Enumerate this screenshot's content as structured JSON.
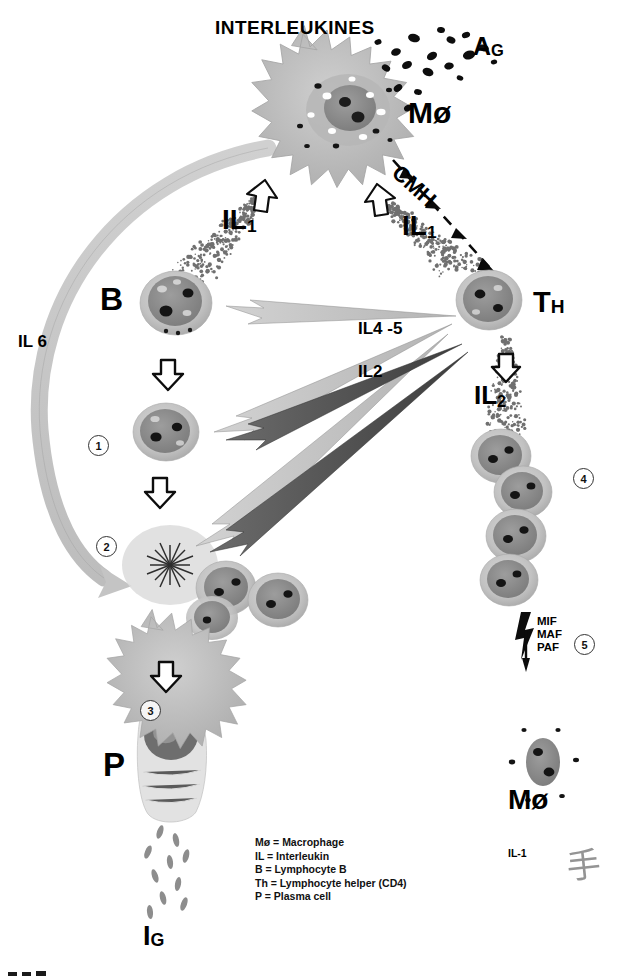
{
  "diagram": {
    "title": "INTERLEUKINES",
    "labels": {
      "antigen": "A",
      "antigen_sub": "G",
      "macrophage_top": "Mø",
      "macrophage_bottom": "Mø",
      "cmh": "CMH",
      "il1_left": "IL",
      "il1_left_sub": "1",
      "il1_right": "IL",
      "il1_right_sub": "1",
      "il6": "IL 6",
      "b_cell": "B",
      "t_helper": "T",
      "t_helper_sub": "H",
      "il45": "IL4 -5",
      "il2_center": "IL2",
      "il2_right": "IL",
      "il2_right_sub": "2",
      "plasma": "P",
      "ig": "I",
      "ig_sub": "G",
      "mif": "MIF",
      "maf": "MAF",
      "paf": "PAF",
      "il1_bottom": "IL-1"
    },
    "step_numbers": [
      "1",
      "2",
      "3",
      "4",
      "5"
    ],
    "legend": [
      "Mø = Macrophage",
      "IL = Interleukin",
      "B = Lymphocyte B",
      "Th = Lymphocyte helper (CD4)",
      "P = Plasma cell"
    ],
    "signature": "手",
    "colors": {
      "ink": "#000000",
      "cell_fill": "#b9b9b9",
      "cell_nucleus": "#8f8f8f",
      "arrow_light": "#c9c9c9",
      "arrow_dark": "#4a4a4a",
      "background": "#ffffff"
    }
  }
}
